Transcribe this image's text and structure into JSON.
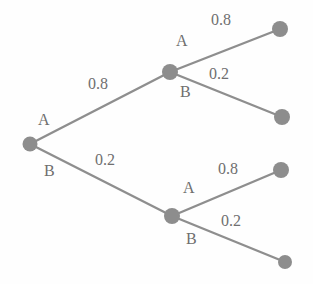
{
  "figure": {
    "type": "probability-tree-diagram",
    "width": 313,
    "height": 284,
    "background_color": "#fefefe",
    "node_color": "#8d8d8d",
    "edge_color": "#8e8e8e",
    "text_color": "#6f6f6f"
  },
  "nodes": [
    {
      "id": "root",
      "name": "root-node",
      "x": 30,
      "y": 144
    },
    {
      "id": "n_a",
      "name": "node-a",
      "x": 170,
      "y": 72
    },
    {
      "id": "n_b",
      "name": "node-b",
      "x": 172,
      "y": 216
    },
    {
      "id": "l_aa",
      "name": "leaf-aa",
      "x": 280,
      "y": 29
    },
    {
      "id": "l_ab",
      "name": "leaf-ab",
      "x": 282,
      "y": 117
    },
    {
      "id": "l_ba",
      "name": "leaf-ba",
      "x": 281,
      "y": 170
    },
    {
      "id": "l_bb",
      "name": "leaf-bb",
      "x": 285,
      "y": 262
    }
  ],
  "edges": [
    {
      "id": "e_root_a",
      "name": "edge-root-to-a",
      "from": "root",
      "to": "n_a",
      "branch": "A",
      "probability": "0.8"
    },
    {
      "id": "e_root_b",
      "name": "edge-root-to-b",
      "from": "root",
      "to": "n_b",
      "branch": "B",
      "probability": "0.2"
    },
    {
      "id": "e_a_aa",
      "name": "edge-a-to-aa",
      "from": "n_a",
      "to": "l_aa",
      "branch": "A",
      "probability": "0.8"
    },
    {
      "id": "e_a_ab",
      "name": "edge-a-to-ab",
      "from": "n_a",
      "to": "l_ab",
      "branch": "B",
      "probability": "0.2"
    },
    {
      "id": "e_b_ba",
      "name": "edge-b-to-ba",
      "from": "n_b",
      "to": "l_ba",
      "branch": "A",
      "probability": "0.8"
    },
    {
      "id": "e_b_bb",
      "name": "edge-b-to-bb",
      "from": "n_b",
      "to": "l_bb",
      "branch": "B",
      "probability": "0.2"
    }
  ],
  "labels": {
    "branch_root_a": {
      "text": "A",
      "x": 38,
      "y": 112
    },
    "prob_root_a": {
      "text": "0.8",
      "x": 88,
      "y": 76
    },
    "branch_root_b": {
      "text": "B",
      "x": 44,
      "y": 163
    },
    "prob_root_b": {
      "text": "0.2",
      "x": 95,
      "y": 152
    },
    "branch_a_aa": {
      "text": "A",
      "x": 176,
      "y": 33
    },
    "prob_a_aa": {
      "text": "0.8",
      "x": 211,
      "y": 12
    },
    "branch_a_ab": {
      "text": "B",
      "x": 180,
      "y": 84
    },
    "prob_a_ab": {
      "text": "0.2",
      "x": 209,
      "y": 66
    },
    "branch_b_ba": {
      "text": "A",
      "x": 183,
      "y": 180
    },
    "prob_b_ba": {
      "text": "0.8",
      "x": 218,
      "y": 161
    },
    "branch_b_bb": {
      "text": "B",
      "x": 186,
      "y": 231
    },
    "prob_b_bb": {
      "text": "0.2",
      "x": 221,
      "y": 213
    }
  }
}
